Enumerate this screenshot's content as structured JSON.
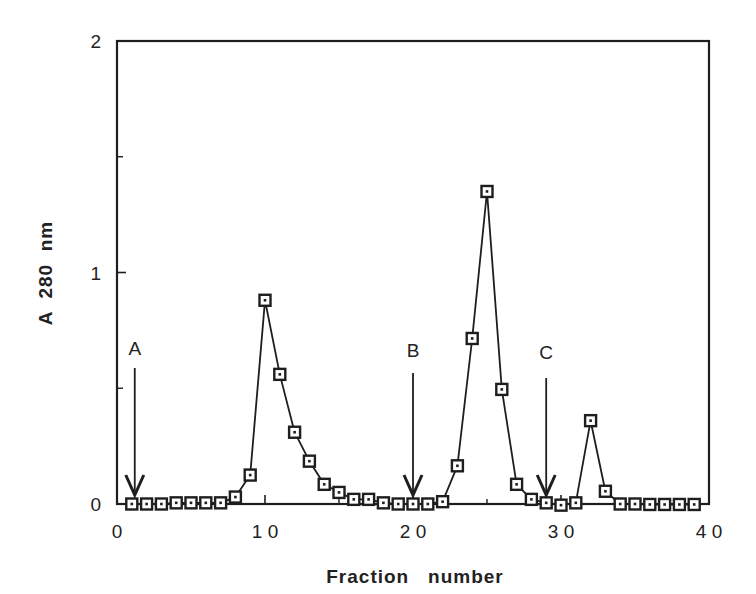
{
  "chart_data": {
    "type": "line",
    "title": "",
    "xlabel": "Fraction   number",
    "ylabel": "A  280  nm",
    "xlim": [
      0,
      40
    ],
    "ylim": [
      0,
      2
    ],
    "x_ticks": [
      0,
      10,
      20,
      30,
      40
    ],
    "x_tick_labels": [
      "0",
      "10",
      "20",
      "30",
      "40"
    ],
    "x_minor_ticks": [
      5,
      15,
      25,
      35
    ],
    "y_ticks": [
      0,
      1,
      2
    ],
    "y_tick_labels": [
      "0",
      "1",
      "2"
    ],
    "y_minor_ticks": [
      0.5,
      1.5
    ],
    "grid": false,
    "legend": null,
    "marker": "open-square",
    "series": [
      {
        "name": "A280",
        "x": [
          1,
          2,
          3,
          4,
          5,
          6,
          7,
          8,
          9,
          10,
          11,
          12,
          13,
          14,
          15,
          16,
          17,
          18,
          19,
          20,
          21,
          22,
          23,
          24,
          25,
          26,
          27,
          28,
          29,
          30,
          31,
          32,
          33,
          34,
          35,
          36,
          37,
          38,
          39
        ],
        "values": [
          0,
          0,
          0,
          0.005,
          0.005,
          0.005,
          0.005,
          0.03,
          0.125,
          0.88,
          0.56,
          0.31,
          0.185,
          0.085,
          0.05,
          0.02,
          0.02,
          0.005,
          0,
          0,
          0,
          0.01,
          0.165,
          0.715,
          1.35,
          0.495,
          0.085,
          0.02,
          0.005,
          -0.005,
          0.005,
          0.36,
          0.055,
          0,
          0,
          -0.002,
          -0.002,
          -0.002,
          -0.002
        ]
      }
    ],
    "annotations": [
      {
        "label": "A",
        "x": 1.2,
        "type": "down-arrow"
      },
      {
        "label": "B",
        "x": 20,
        "type": "down-arrow"
      },
      {
        "label": "C",
        "x": 29,
        "type": "down-arrow"
      }
    ]
  },
  "labels": {
    "xlabel": "Fraction   number",
    "ylabel": "A  280  nm",
    "annot_a": "A",
    "annot_b": "B",
    "annot_c": "C"
  }
}
